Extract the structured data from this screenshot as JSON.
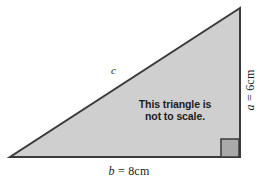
{
  "figure": {
    "kind": "right-triangle-diagram",
    "note": {
      "line1": "This triangle is",
      "line2": "not to scale."
    },
    "labels": {
      "hypotenuse": "c",
      "base_var": "b",
      "base_eq": "= 8cm",
      "base_full": "b = 8cm",
      "height_var": "a",
      "height_eq": "= 6cm",
      "height_full": "a = 6cm"
    },
    "measurements": {
      "base_value": 8,
      "height_value": 6,
      "units": "cm",
      "hypotenuse_value": null
    },
    "geometry": {
      "apex_left": [
        10,
        157
      ],
      "corner_right": [
        240,
        157
      ],
      "apex_top": [
        240,
        8
      ],
      "right_angle_marker": [
        221,
        139,
        18,
        18
      ]
    },
    "colors": {
      "triangle_fill": "#cfcfcf",
      "triangle_stroke": "#3a3a3a",
      "right_angle_fill": "#a9a9a9",
      "right_angle_stroke": "#3a3a3a",
      "background": "#ffffff",
      "text": "#1c1c1c"
    }
  }
}
